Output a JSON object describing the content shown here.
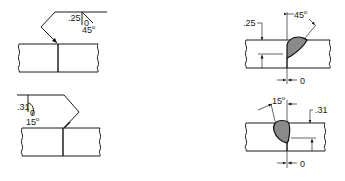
{
  "figures": [
    {
      "id": "top-left",
      "kind": "weld-symbol",
      "groove_depth": ".25",
      "root_opening": "0",
      "groove_angle": "45",
      "angle_unit": "o"
    },
    {
      "id": "top-right",
      "kind": "weld-section",
      "groove_depth": ".25",
      "root_opening": "0",
      "groove_angle": "45",
      "angle_unit": "o"
    },
    {
      "id": "bottom-left",
      "kind": "weld-symbol",
      "groove_depth": ".31",
      "root_opening": "0",
      "groove_angle": "15",
      "angle_unit": "o"
    },
    {
      "id": "bottom-right",
      "kind": "weld-section",
      "groove_depth": ".31",
      "root_opening": "0",
      "groove_angle": "15",
      "angle_unit": "o"
    }
  ],
  "colors": {
    "line": "#1a1a1a",
    "bead_fill": "#8a8a8a",
    "background": "#ffffff"
  }
}
